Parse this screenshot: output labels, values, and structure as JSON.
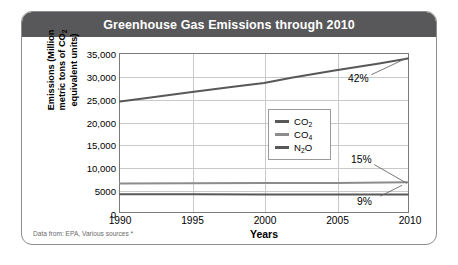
{
  "card": {
    "title": "Greenhouse Gas Emissions through 2010",
    "footnote": "Data from: EPA, Various sources *"
  },
  "chart_data": {
    "type": "line",
    "title": "Greenhouse Gas Emissions through 2010",
    "xlabel": "Years",
    "ylabel": "Emissions (Million metric tons of CO2 equivalent units)",
    "ylabel_lines": [
      "Emissions (Million",
      "metric tons of CO",
      "equivalent units)"
    ],
    "ylabel_sub": "2",
    "xlim": [
      1990,
      2010
    ],
    "ylim": [
      0,
      35000
    ],
    "grid": true,
    "legend_position": "center",
    "x": [
      1990,
      1995,
      2000,
      2005,
      2010
    ],
    "xticks": [
      "1990",
      "1995",
      "2000",
      "2005",
      "2010"
    ],
    "yticks": [
      0,
      5000,
      10000,
      15000,
      20000,
      25000,
      30000,
      35000
    ],
    "ytick_labels": [
      "0",
      "5000",
      "10,000",
      "15,000",
      "20,000",
      "25,000",
      "30,000",
      "35,000"
    ],
    "series": [
      {
        "name": "CO2",
        "label_base": "CO",
        "label_sub": "2",
        "color": "#58585a",
        "x": [
          1990,
          1992,
          1995,
          1998,
          2000,
          2002,
          2005,
          2008,
          2010
        ],
        "values": [
          24500,
          25300,
          26600,
          27800,
          28600,
          29800,
          31400,
          32900,
          34000
        ],
        "annotation": "42%"
      },
      {
        "name": "CO4",
        "label_base": "CO",
        "label_sub": "4",
        "color": "#8c8c8e",
        "x": [
          1990,
          1995,
          2000,
          2005,
          2010
        ],
        "values": [
          6300,
          6350,
          6400,
          6450,
          6600
        ],
        "annotation": "15%"
      },
      {
        "name": "N2O",
        "label_base": "N",
        "label_sub": "2",
        "label_tail": "O",
        "color": "#58585a",
        "x": [
          1990,
          1995,
          2000,
          2005,
          2010
        ],
        "values": [
          3950,
          3930,
          3900,
          3880,
          3850
        ],
        "annotation": "9%"
      }
    ],
    "annotations": [
      {
        "text": "42%",
        "series": "CO2"
      },
      {
        "text": "15%",
        "series": "CO4"
      },
      {
        "text": "9%",
        "series": "N2O"
      }
    ],
    "colors": {
      "title_bar": "#58585a",
      "co2_line": "#58585a",
      "co4_line": "#8c8c8e",
      "n2o_line": "#58585a",
      "grid": "#c9c9c9",
      "axis": "#7a7a7a"
    }
  }
}
